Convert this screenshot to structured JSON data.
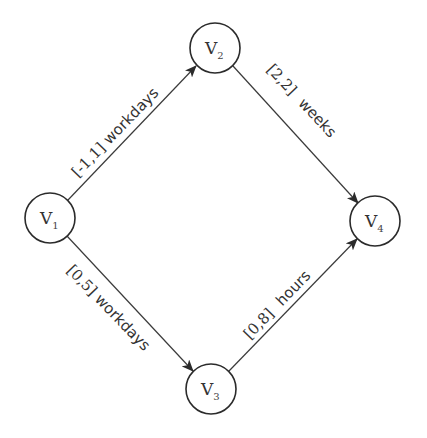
{
  "diagram": {
    "type": "directed-graph",
    "colors": {
      "background": "#ffffff",
      "stroke": "#2b2b2b",
      "text": "#333333"
    },
    "nodes": [
      {
        "id": "V1",
        "letter": "V",
        "sub": "1",
        "cx": 50,
        "cy": 218,
        "r": 25
      },
      {
        "id": "V2",
        "letter": "V",
        "sub": "2",
        "cx": 215,
        "cy": 48,
        "r": 25
      },
      {
        "id": "V3",
        "letter": "V",
        "sub": "3",
        "cx": 211,
        "cy": 389,
        "r": 25
      },
      {
        "id": "V4",
        "letter": "V",
        "sub": "4",
        "cx": 375,
        "cy": 221,
        "r": 25
      }
    ],
    "edges": [
      {
        "from": "V1",
        "to": "V2",
        "range": "[-1,1]",
        "unit": "workdays",
        "label": "[-1,1] workdays"
      },
      {
        "from": "V2",
        "to": "V4",
        "range": "[2,2]",
        "unit": "weeks",
        "label": "[2,2] weeks"
      },
      {
        "from": "V1",
        "to": "V3",
        "range": "[0,5]",
        "unit": "workdays",
        "label": "[0,5] workdays"
      },
      {
        "from": "V3",
        "to": "V4",
        "range": "[0,8]",
        "unit": "hours",
        "label": "[0,8] hours"
      }
    ]
  }
}
